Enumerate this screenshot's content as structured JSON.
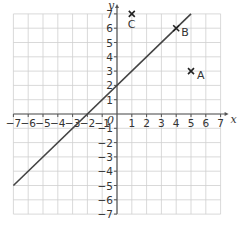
{
  "chart_data": {
    "type": "line",
    "title": "",
    "xlabel": "x",
    "ylabel": "y",
    "origin_label": "0",
    "xlim": [
      -7,
      7
    ],
    "ylim": [
      -7,
      7
    ],
    "grid": true,
    "x_ticks": [
      "-7",
      "-6",
      "-5",
      "-4",
      "-3",
      "-2",
      "-1",
      "1",
      "2",
      "3",
      "4",
      "5",
      "6",
      "7"
    ],
    "y_ticks": [
      "7",
      "6",
      "5",
      "4",
      "3",
      "2",
      "1",
      "-1",
      "-2",
      "-3",
      "-4",
      "-5",
      "-6",
      "-7"
    ],
    "series": [
      {
        "name": "line",
        "equation": "y = x + 2",
        "x": [
          -7,
          5
        ],
        "y": [
          -5,
          7
        ]
      }
    ],
    "points": [
      {
        "label": "A",
        "x": 5,
        "y": 3
      },
      {
        "label": "B",
        "x": 4,
        "y": 6
      },
      {
        "label": "C",
        "x": 1,
        "y": 7
      }
    ]
  },
  "colors": {
    "grid": "#cfcfcf",
    "axis": "#555555",
    "line": "#444444",
    "text": "#333333"
  }
}
